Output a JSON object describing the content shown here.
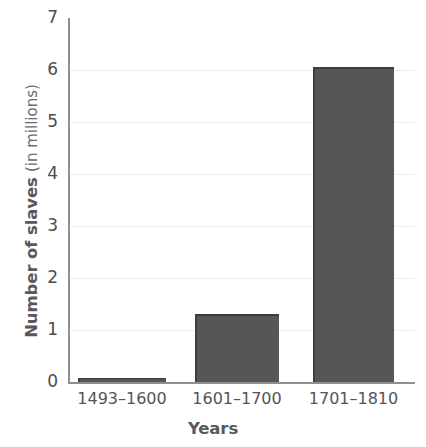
{
  "chart_data": {
    "type": "bar",
    "title": "",
    "categories": [
      "1493–1600",
      "1601–1700",
      "1701–1810"
    ],
    "values": [
      0.08,
      1.3,
      6.05
    ],
    "xlabel": "Years",
    "ylabel": "Number of slaves (in millions)",
    "ylabel_bold_part": "Number of slaves",
    "ylabel_light_part": "(in millions)",
    "ylim": [
      0,
      7
    ],
    "yticks": [
      0,
      1,
      2,
      3,
      4,
      5,
      6,
      7
    ],
    "ytick_labels": [
      "0",
      "1",
      "2",
      "3",
      "4",
      "5",
      "6",
      "7"
    ],
    "grid": true,
    "grid_axis": "y",
    "legend": null,
    "bar_color": "#565656",
    "bar_edge_color": "#3f3f3f",
    "axis_color": "#8f8f8f",
    "grid_color": "#ededed",
    "text_color": "#555555",
    "label_color": "#595959",
    "background": "#ffffff"
  }
}
